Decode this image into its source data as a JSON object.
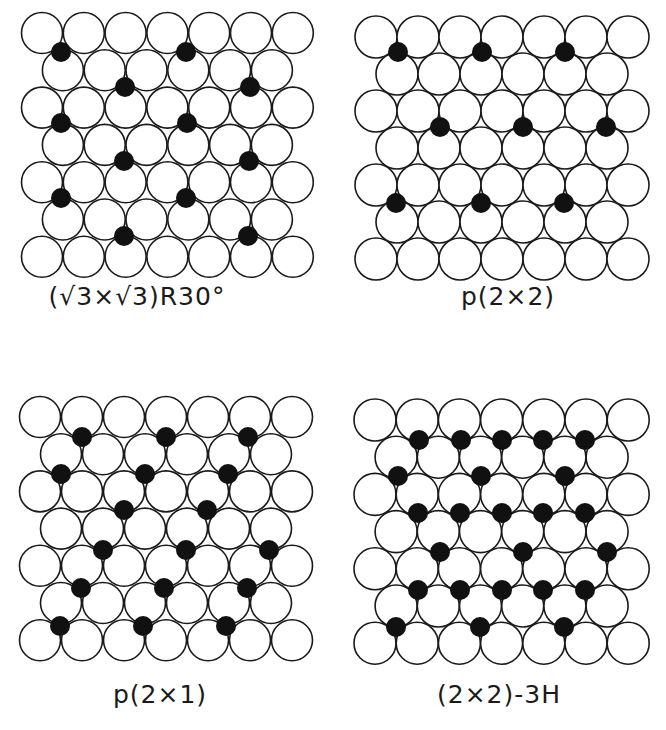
{
  "figure": {
    "colors": {
      "substrate_fill": "#ffffff",
      "substrate_stroke": "#1a1a1a",
      "adsorbate_fill": "#111111",
      "background": "#ffffff"
    }
  },
  "panels": [
    {
      "id": "sqrt3",
      "label": "(√3×√3)R30°",
      "label_pos": [
        137,
        282
      ],
      "lattice": {
        "x0": 42,
        "y0": 33,
        "dx": 41.8,
        "dy": 37.3,
        "rows": 7,
        "cols": 7,
        "r": 20.5
      },
      "adsorbates": [
        [
          61,
          52
        ],
        [
          186,
          52
        ],
        [
          125,
          87
        ],
        [
          250,
          87
        ],
        [
          61,
          123
        ],
        [
          187,
          123
        ],
        [
          124,
          161
        ],
        [
          249,
          161
        ],
        [
          61,
          198
        ],
        [
          186,
          198
        ],
        [
          124,
          236
        ],
        [
          248,
          236
        ]
      ]
    },
    {
      "id": "p2x2",
      "label": "p(2×2)",
      "label_pos": [
        508,
        282
      ],
      "lattice": {
        "x0": 376,
        "y0": 37,
        "dx": 42,
        "dy": 37,
        "rows": 7,
        "cols": 7,
        "r": 21
      },
      "adsorbates": [
        [
          398,
          52
        ],
        [
          482,
          52
        ],
        [
          565,
          52
        ],
        [
          440,
          127
        ],
        [
          523,
          127
        ],
        [
          606,
          127
        ],
        [
          396,
          203
        ],
        [
          481,
          203
        ],
        [
          564,
          203
        ]
      ]
    },
    {
      "id": "p2x1",
      "label": "p(2×1)",
      "label_pos": [
        160,
        680
      ],
      "lattice": {
        "x0": 40,
        "y0": 417,
        "dx": 42,
        "dy": 37.2,
        "rows": 7,
        "cols": 7,
        "r": 20.5
      },
      "adsorbates": [
        [
          82,
          437
        ],
        [
          166,
          437
        ],
        [
          248,
          437
        ],
        [
          61,
          474
        ],
        [
          145,
          474
        ],
        [
          228,
          474
        ],
        [
          124,
          510
        ],
        [
          207,
          510
        ],
        [
          103,
          550
        ],
        [
          186,
          550
        ],
        [
          269,
          550
        ],
        [
          81,
          588
        ],
        [
          164,
          588
        ],
        [
          247,
          588
        ],
        [
          60,
          626
        ],
        [
          143,
          626
        ],
        [
          226,
          626
        ]
      ]
    },
    {
      "id": "2x2-3H",
      "label": "(2×2)-3H",
      "label_pos": [
        499,
        680
      ],
      "lattice": {
        "x0": 375,
        "y0": 420,
        "dx": 42.2,
        "dy": 37.2,
        "rows": 7,
        "cols": 7,
        "r": 21
      },
      "adsorbates": [
        [
          419,
          440
        ],
        [
          461,
          440
        ],
        [
          502,
          440
        ],
        [
          543,
          440
        ],
        [
          585,
          440
        ],
        [
          398,
          476
        ],
        [
          481,
          476
        ],
        [
          565,
          476
        ],
        [
          418,
          513
        ],
        [
          460,
          513
        ],
        [
          502,
          513
        ],
        [
          543,
          513
        ],
        [
          585,
          513
        ],
        [
          440,
          552
        ],
        [
          523,
          552
        ],
        [
          607,
          552
        ],
        [
          418,
          590
        ],
        [
          460,
          590
        ],
        [
          502,
          590
        ],
        [
          543,
          590
        ],
        [
          585,
          590
        ],
        [
          396,
          627
        ],
        [
          480,
          627
        ],
        [
          564,
          627
        ]
      ]
    }
  ]
}
